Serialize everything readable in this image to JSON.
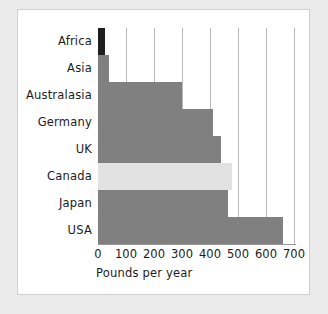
{
  "chart_data": {
    "type": "bar",
    "orientation": "horizontal",
    "title": "",
    "xlabel": "Pounds per year",
    "ylabel": "",
    "categories": [
      "Africa",
      "Asia",
      "Australasia",
      "Germany",
      "UK",
      "Canada",
      "Japan",
      "USA"
    ],
    "values": [
      25,
      40,
      300,
      410,
      440,
      480,
      465,
      660
    ],
    "xlim": [
      0,
      700
    ],
    "xticks": [
      0,
      100,
      200,
      300,
      400,
      500,
      600,
      700
    ],
    "xticklabels": [
      "0",
      "100",
      "200",
      "300",
      "400",
      "500",
      "600",
      "700"
    ],
    "grid": "vertical",
    "legend": "none",
    "bar_colors": [
      "#1f1f1f",
      "#808080",
      "#808080",
      "#808080",
      "#808080",
      "#e2e2e2",
      "#808080",
      "#808080"
    ],
    "highlight_category": "Canada"
  },
  "colors": {
    "page_background": "#ebebeb",
    "card_background": "#ffffff",
    "card_border": "#cfcfcf",
    "bar_default": "#808080",
    "bar_highlight": "#e2e2e2",
    "bar_dark": "#1f1f1f",
    "gridline": "#b9b9b9",
    "axis_line": "#9a9a9a",
    "text": "#1c1c1c"
  }
}
